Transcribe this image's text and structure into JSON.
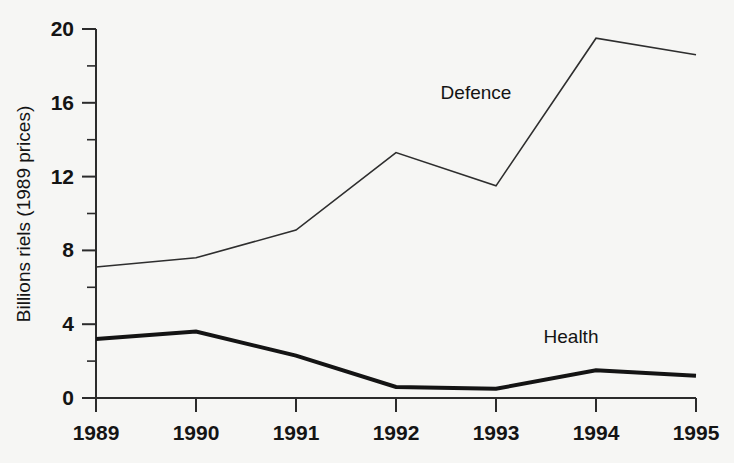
{
  "chart_data": {
    "type": "line",
    "title": "",
    "xlabel": "",
    "ylabel": "Billions riels (1989 prices)",
    "x": [
      "1989",
      "1990",
      "1991",
      "1992",
      "1993",
      "1994",
      "1995"
    ],
    "xlim": [
      1989,
      1995
    ],
    "ylim": [
      0,
      20
    ],
    "y_ticks_major": [
      "0",
      "4",
      "8",
      "12",
      "16",
      "20"
    ],
    "y_ticks_minor": [
      2,
      6,
      10,
      14,
      18
    ],
    "grid": false,
    "legend_position": "inline-annotations",
    "series": [
      {
        "name": "Defence",
        "values": [
          7.1,
          7.6,
          9.1,
          13.3,
          11.5,
          19.5,
          18.6
        ],
        "line_style": "thin",
        "color": "#2e2e2e",
        "annotation": {
          "text": "Defence",
          "x_value": 1992.8,
          "y_value": 16.2
        }
      },
      {
        "name": "Health",
        "values": [
          3.2,
          3.6,
          2.3,
          0.6,
          0.5,
          1.5,
          1.2
        ],
        "line_style": "thick",
        "color": "#141414",
        "annotation": {
          "text": "Health",
          "x_value": 1993.75,
          "y_value": 3.0
        }
      }
    ]
  },
  "colors": {
    "background": "#f6f6f4",
    "axis": "#2b2b2b",
    "text": "#141414",
    "defence": "#2e2e2e",
    "health": "#141414"
  }
}
